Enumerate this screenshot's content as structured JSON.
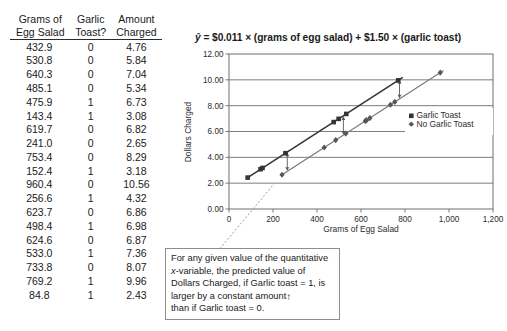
{
  "table": {
    "headers": [
      "Grams of\nEgg Salad",
      "Garlic\nToast?",
      "Amount\nCharged"
    ],
    "rows": [
      [
        "432.9",
        "0",
        "4.76"
      ],
      [
        "530.8",
        "0",
        "5.84"
      ],
      [
        "640.3",
        "0",
        "7.04"
      ],
      [
        "485.1",
        "0",
        "5.34"
      ],
      [
        "475.9",
        "1",
        "6.73"
      ],
      [
        "143.4",
        "1",
        "3.08"
      ],
      [
        "619.7",
        "0",
        "6.82"
      ],
      [
        "241.0",
        "0",
        "2.65"
      ],
      [
        "753.4",
        "0",
        "8.29"
      ],
      [
        "152.4",
        "1",
        "3.18"
      ],
      [
        "960.4",
        "0",
        "10.56"
      ],
      [
        "256.6",
        "1",
        "4.32"
      ],
      [
        "623.7",
        "0",
        "6.86"
      ],
      [
        "498.4",
        "1",
        "6.98"
      ],
      [
        "624.6",
        "0",
        "6.87"
      ],
      [
        "533.0",
        "1",
        "7.36"
      ],
      [
        "733.8",
        "0",
        "8.07"
      ],
      [
        "769.2",
        "1",
        "9.96"
      ],
      [
        "84.8",
        "1",
        "2.43"
      ]
    ]
  },
  "equation": {
    "yhat": "ŷ",
    "text": " = $0.011 × (grams of egg salad) + $1.50 × (garlic toast)"
  },
  "callout": {
    "line1": "For any given value of the quantitative",
    "line2_italic": "x",
    "line2_rest": "-variable, the predicted value of",
    "line3": "Dollars Charged, if Garlic toast = 1, is",
    "line4": "larger by a constant amount",
    "line4_arrow": "↑",
    "line5": "than if Garlic toast = 0."
  },
  "chart_data": {
    "type": "scatter",
    "title": "",
    "xlabel": "Grams of Egg Salad",
    "ylabel": "Dollars Charged",
    "xlim": [
      0,
      1200
    ],
    "ylim": [
      0,
      12
    ],
    "xticks": [
      0,
      200,
      400,
      600,
      800,
      1000,
      1200
    ],
    "xticklabels": [
      "0",
      "200",
      "400",
      "600",
      "800",
      "1,000",
      "1,200"
    ],
    "yticks": [
      0,
      2,
      4,
      6,
      8,
      10,
      12
    ],
    "yticklabels": [
      "0.00",
      "2.00",
      "4.00",
      "6.00",
      "8.00",
      "10.00",
      "12.00"
    ],
    "grid": "horizontal",
    "legend_position": "center-right",
    "series": [
      {
        "name": "Garlic Toast",
        "marker": "square",
        "color": "#333333",
        "points": [
          [
            475.9,
            6.73
          ],
          [
            143.4,
            3.08
          ],
          [
            152.4,
            3.18
          ],
          [
            256.6,
            4.32
          ],
          [
            498.4,
            6.98
          ],
          [
            533.0,
            7.36
          ],
          [
            769.2,
            9.96
          ],
          [
            84.8,
            2.43
          ]
        ],
        "fit_line": {
          "intercept": 1.5,
          "slope": 0.011,
          "x_from": 84.8,
          "x_to": 790
        }
      },
      {
        "name": "No Garlic Toast",
        "marker": "diamond",
        "color": "#555555",
        "points": [
          [
            432.9,
            4.76
          ],
          [
            530.8,
            5.84
          ],
          [
            640.3,
            7.04
          ],
          [
            485.1,
            5.34
          ],
          [
            619.7,
            6.82
          ],
          [
            241.0,
            2.65
          ],
          [
            753.4,
            8.29
          ],
          [
            960.4,
            10.56
          ],
          [
            623.7,
            6.86
          ],
          [
            624.6,
            6.87
          ],
          [
            733.8,
            8.07
          ]
        ],
        "fit_line": {
          "intercept": 0.0,
          "slope": 0.011,
          "x_from": 241.0,
          "x_to": 975
        }
      }
    ],
    "annotations": [
      {
        "type": "gap-arrow",
        "x": 265,
        "note": "constant vertical offset"
      },
      {
        "type": "gap-arrow",
        "x": 520,
        "note": "constant vertical offset"
      },
      {
        "type": "gap-arrow",
        "x": 775,
        "note": "constant vertical offset"
      }
    ]
  },
  "legend": {
    "items": [
      {
        "label": "Garlic Toast",
        "marker": "square"
      },
      {
        "label": "No Garlic Toast",
        "marker": "diamond"
      }
    ]
  }
}
